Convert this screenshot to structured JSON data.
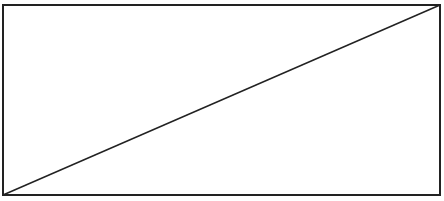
{
  "diagram": {
    "shape": "rectangle-with-diagonal",
    "stroke_color": "#222222",
    "fill_color": "#ffffff",
    "rectangle": {
      "x": 3,
      "y": 5,
      "width": 437,
      "height": 190,
      "stroke_width": 2
    },
    "diagonal": {
      "x1": 3,
      "y1": 195,
      "x2": 440,
      "y2": 5,
      "stroke_width": 1.5
    }
  }
}
